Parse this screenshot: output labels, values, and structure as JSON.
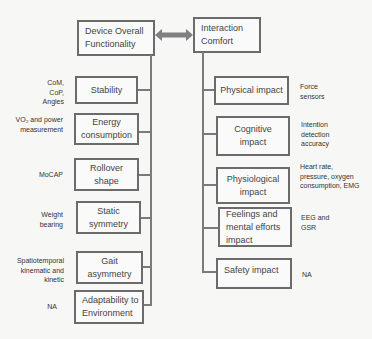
{
  "diagram": {
    "left_root": {
      "label": "Device Overall Functionality"
    },
    "right_root": {
      "label": "Interaction Comfort"
    },
    "connector": "bidirectional-arrow",
    "left_items": [
      {
        "label": "Stability",
        "note": "CoM, CoP, Angles"
      },
      {
        "label": "Energy consumption",
        "note": "VO₂ and power measurement"
      },
      {
        "label": "Rollover shape",
        "note": "MoCAP"
      },
      {
        "label": "Static symmetry",
        "note": "Weight bearing"
      },
      {
        "label": "Gait asymmetry",
        "note": "Spatiotemporal kinematic and kinetic"
      },
      {
        "label": "Adaptability to Environment",
        "note": "NA"
      }
    ],
    "right_items": [
      {
        "label": "Physical impact",
        "note": "Force sensors"
      },
      {
        "label": "Cognitive impact",
        "note": "Intention detection accuracy"
      },
      {
        "label": "Physiological impact",
        "note": "Heart rate, pressure, oxygen consumption, EMG"
      },
      {
        "label": "Feelings and mental efforts impact",
        "note": "EEG and GSR"
      },
      {
        "label": "Safety impact",
        "note": "NA"
      }
    ],
    "colors": {
      "border": "#6b6b6b",
      "line": "#7a7a7a",
      "arrow": "#808080",
      "background": "#f7f7f6"
    }
  }
}
